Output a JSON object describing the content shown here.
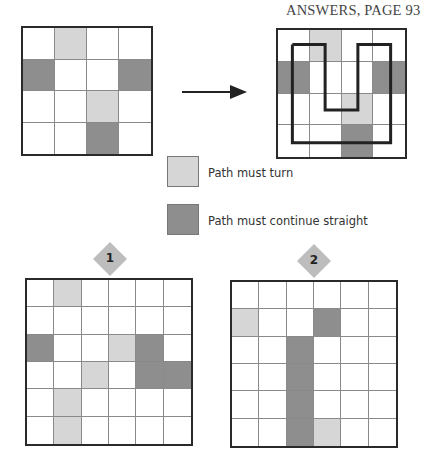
{
  "header": {
    "text": "ANSWERS, PAGE 93"
  },
  "colors": {
    "turn": "#d6d6d6",
    "straight": "#8e8e8e",
    "border": "#2a2a2a",
    "gridline": "#8a8a8a",
    "path": "#222222",
    "badge": "#bdbdbd"
  },
  "legend": {
    "items": [
      {
        "type": "L",
        "label": "Path must turn"
      },
      {
        "type": "D",
        "label": "Path must continue straight"
      }
    ]
  },
  "example": {
    "size": 4,
    "cells": [
      [
        ".",
        "L",
        ".",
        "."
      ],
      [
        "D",
        ".",
        ".",
        "D"
      ],
      [
        ".",
        ".",
        "L",
        "."
      ],
      [
        ".",
        ".",
        "D",
        "."
      ]
    ],
    "solution_path": [
      [
        0.5,
        0.5
      ],
      [
        1.5,
        0.5
      ],
      [
        1.5,
        2.5
      ],
      [
        2.5,
        2.5
      ],
      [
        2.5,
        0.5
      ],
      [
        3.5,
        0.5
      ],
      [
        3.5,
        3.5
      ],
      [
        0.5,
        3.5
      ],
      [
        0.5,
        0.5
      ]
    ]
  },
  "puzzles": [
    {
      "number": "1",
      "size": 6,
      "cells": [
        [
          ".",
          "L",
          ".",
          ".",
          ".",
          "."
        ],
        [
          ".",
          ".",
          ".",
          ".",
          ".",
          "."
        ],
        [
          "D",
          ".",
          ".",
          "L",
          "D",
          "."
        ],
        [
          ".",
          ".",
          "L",
          ".",
          "D",
          "D"
        ],
        [
          ".",
          "L",
          ".",
          ".",
          ".",
          "."
        ],
        [
          ".",
          "L",
          ".",
          ".",
          ".",
          "."
        ]
      ]
    },
    {
      "number": "2",
      "size": 6,
      "cells": [
        [
          ".",
          ".",
          ".",
          ".",
          ".",
          "."
        ],
        [
          "L",
          ".",
          ".",
          "D",
          ".",
          "."
        ],
        [
          ".",
          ".",
          "D",
          ".",
          ".",
          "."
        ],
        [
          ".",
          ".",
          "D",
          ".",
          ".",
          "."
        ],
        [
          ".",
          ".",
          "D",
          ".",
          ".",
          "."
        ],
        [
          ".",
          ".",
          "D",
          "L",
          ".",
          "."
        ]
      ]
    }
  ]
}
